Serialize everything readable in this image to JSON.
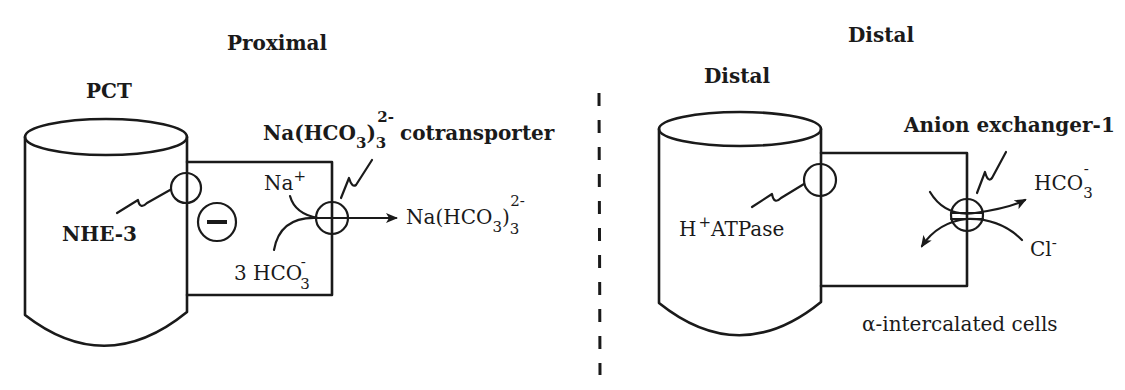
{
  "proximal": {
    "section_title": "Proximal",
    "segment_label": "PCT",
    "transporter_1": "NHE-3",
    "charge_symbol": "minus",
    "cotransporter": {
      "label_main": "Na(HCO",
      "label_sub_inner": "3",
      "label_close": ")",
      "label_sub_outer": "3",
      "label_sup": "2-",
      "label_suffix": "cotransporter"
    },
    "input_na": {
      "main": "Na",
      "sup": "+"
    },
    "input_hco3": {
      "main": "3 HCO",
      "sub": "3",
      "sup": "-"
    },
    "output": {
      "main": "Na(HCO",
      "sub_inner": "3",
      "close": ")",
      "sub_outer": "3",
      "sup": "2-"
    }
  },
  "distal": {
    "section_title": "Distal",
    "segment_label": "Distal",
    "pump": {
      "prefix": "H",
      "sup": "+",
      "suffix": "ATPase"
    },
    "exchanger_label": "Anion exchanger-1",
    "output_hco3": {
      "main": "HCO",
      "sub": "3",
      "sup": "-"
    },
    "input_cl": {
      "main": "Cl",
      "sup": "-"
    },
    "cell_label": "α-intercalated cells"
  },
  "divider": {
    "style": "dashed"
  },
  "colors": {
    "line": "#1a1a1a",
    "background": "#ffffff"
  }
}
